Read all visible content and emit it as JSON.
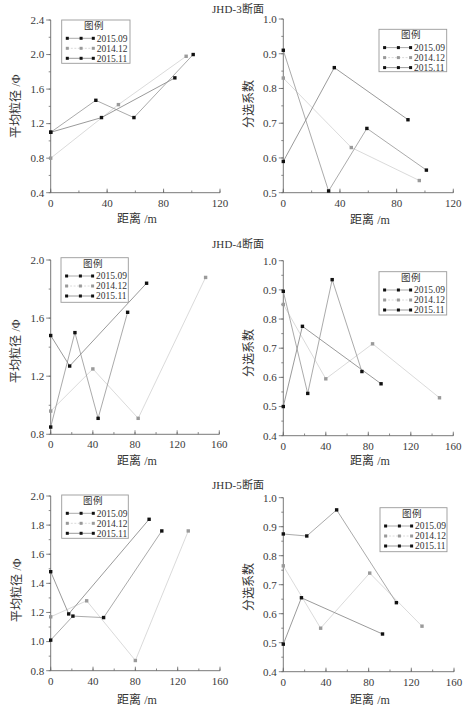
{
  "sections": [
    {
      "title": "JHD-3断面"
    },
    {
      "title": "JHD-4断面"
    },
    {
      "title": "JHD-5断面"
    }
  ],
  "chart_data": [
    {
      "id": "jhd3-mean-grain-size",
      "section": "JHD-3断面",
      "type": "line",
      "title": "",
      "xlabel": "距离 /m",
      "ylabel": "平均粒径 /Φ",
      "xlim": [
        0,
        120
      ],
      "xticks": [
        0,
        40,
        80,
        120
      ],
      "xtick_labels": [
        "0",
        "40",
        "80",
        "120"
      ],
      "xminor": 20,
      "ylim": [
        0.4,
        2.4
      ],
      "yticks": [
        0.4,
        0.8,
        1.2,
        1.6,
        2.0,
        2.4
      ],
      "ytick_labels": [
        "0.4",
        "0.8",
        "1.2",
        "1.6",
        "2.0",
        "2.4"
      ],
      "yminor": 0.2,
      "grid": false,
      "legend_title": "图例",
      "legend_position": "upper left",
      "series": [
        {
          "name": "2015.09",
          "x": [
            0,
            32,
            59,
            101
          ],
          "y": [
            1.1,
            1.47,
            1.27,
            2.0
          ],
          "marker_color": "#111111",
          "line_color": "#a0a0a0"
        },
        {
          "name": "2014.12",
          "x": [
            0,
            48,
            96
          ],
          "y": [
            0.8,
            1.42,
            1.98
          ],
          "marker_color": "#9a9a9a",
          "line_color": "#d6d6d6"
        },
        {
          "name": "2015.11",
          "x": [
            0,
            36,
            88
          ],
          "y": [
            1.1,
            1.27,
            1.73
          ],
          "marker_color": "#111111",
          "line_color": "#8e8e8e"
        }
      ]
    },
    {
      "id": "jhd3-sorting-coefficient",
      "section": "JHD-3断面",
      "type": "line",
      "title": "",
      "xlabel": "距离 /m",
      "ylabel": "分选系数",
      "xlim": [
        0,
        120
      ],
      "xticks": [
        0,
        40,
        80,
        120
      ],
      "xtick_labels": [
        "0",
        "40",
        "80",
        "120"
      ],
      "xminor": 20,
      "ylim": [
        0.5,
        1.0
      ],
      "yticks": [
        0.5,
        0.6,
        0.7,
        0.8,
        0.9,
        1.0
      ],
      "ytick_labels": [
        "0.5",
        "0.6",
        "0.7",
        "0.8",
        "0.9",
        "1.0"
      ],
      "yminor": 0.05,
      "grid": false,
      "legend_title": "图例",
      "legend_position": "upper right",
      "series": [
        {
          "name": "2015.09",
          "x": [
            0,
            32,
            59,
            101
          ],
          "y": [
            0.91,
            0.505,
            0.685,
            0.565
          ],
          "marker_color": "#111111",
          "line_color": "#a0a0a0"
        },
        {
          "name": "2014.12",
          "x": [
            0,
            48,
            96
          ],
          "y": [
            0.83,
            0.63,
            0.535
          ],
          "marker_color": "#9a9a9a",
          "line_color": "#d6d6d6"
        },
        {
          "name": "2015.11",
          "x": [
            0,
            36,
            88
          ],
          "y": [
            0.59,
            0.86,
            0.71
          ],
          "marker_color": "#111111",
          "line_color": "#8e8e8e"
        }
      ]
    },
    {
      "id": "jhd4-mean-grain-size",
      "section": "JHD-4断面",
      "type": "line",
      "title": "",
      "xlabel": "距离 /m",
      "ylabel": "平均粒径 /Φ",
      "xlim": [
        0,
        160
      ],
      "xticks": [
        0,
        40,
        80,
        120,
        160
      ],
      "xtick_labels": [
        "0",
        "40",
        "80",
        "120",
        "160"
      ],
      "xminor": 20,
      "ylim": [
        0.8,
        2.0
      ],
      "yticks": [
        0.8,
        1.2,
        1.6,
        2.0
      ],
      "ytick_labels": [
        "0.8",
        "1.2",
        "1.6",
        "2.0"
      ],
      "yminor": 0.2,
      "grid": false,
      "legend_title": "图例",
      "legend_position": "upper left",
      "series": [
        {
          "name": "2015.09",
          "x": [
            0,
            23,
            45,
            73
          ],
          "y": [
            0.85,
            1.5,
            0.91,
            1.64
          ],
          "marker_color": "#111111",
          "line_color": "#a0a0a0"
        },
        {
          "name": "2014.12",
          "x": [
            0,
            40,
            83,
            147
          ],
          "y": [
            0.96,
            1.25,
            0.91,
            1.88
          ],
          "marker_color": "#9a9a9a",
          "line_color": "#d6d6d6"
        },
        {
          "name": "2015.11",
          "x": [
            0,
            18,
            91
          ],
          "y": [
            1.48,
            1.27,
            1.84
          ],
          "marker_color": "#111111",
          "line_color": "#8e8e8e"
        }
      ]
    },
    {
      "id": "jhd4-sorting-coefficient",
      "section": "JHD-4断面",
      "type": "line",
      "title": "",
      "xlabel": "距离 /m",
      "ylabel": "分选系数",
      "xlim": [
        0,
        160
      ],
      "xticks": [
        0,
        40,
        80,
        120,
        160
      ],
      "xtick_labels": [
        "0",
        "40",
        "80",
        "120",
        "160"
      ],
      "xminor": 20,
      "ylim": [
        0.4,
        1.0
      ],
      "yticks": [
        0.4,
        0.5,
        0.6,
        0.7,
        0.8,
        0.9,
        1.0
      ],
      "ytick_labels": [
        "0.4",
        "0.5",
        "0.6",
        "0.7",
        "0.8",
        "0.9",
        "1.0"
      ],
      "yminor": 0.05,
      "grid": false,
      "legend_title": "图例",
      "legend_position": "upper right",
      "series": [
        {
          "name": "2015.09",
          "x": [
            0,
            23,
            46,
            74
          ],
          "y": [
            0.895,
            0.545,
            0.935,
            0.62
          ],
          "marker_color": "#111111",
          "line_color": "#a0a0a0"
        },
        {
          "name": "2014.12",
          "x": [
            0,
            40,
            84,
            147
          ],
          "y": [
            0.85,
            0.595,
            0.715,
            0.53
          ],
          "marker_color": "#9a9a9a",
          "line_color": "#d6d6d6"
        },
        {
          "name": "2015.11",
          "x": [
            0,
            18,
            92
          ],
          "y": [
            0.5,
            0.775,
            0.578
          ],
          "marker_color": "#111111",
          "line_color": "#8e8e8e"
        }
      ]
    },
    {
      "id": "jhd5-mean-grain-size",
      "section": "JHD-5断面",
      "type": "line",
      "title": "",
      "xlabel": "距离 /m",
      "ylabel": "平均粒径 /Φ",
      "xlim": [
        0,
        160
      ],
      "xticks": [
        0,
        40,
        80,
        120,
        160
      ],
      "xtick_labels": [
        "0",
        "40",
        "80",
        "120",
        "160"
      ],
      "xminor": 20,
      "ylim": [
        0.8,
        2.0
      ],
      "yticks": [
        0.8,
        1.0,
        1.2,
        1.4,
        1.6,
        1.8,
        2.0
      ],
      "ytick_labels": [
        "0.8",
        "1.0",
        "1.2",
        "1.4",
        "1.6",
        "1.8",
        "2.0"
      ],
      "yminor": 0.1,
      "grid": false,
      "legend_title": "图例",
      "legend_position": "upper left",
      "series": [
        {
          "name": "2015.09",
          "x": [
            0,
            21,
            50,
            105
          ],
          "y": [
            1.01,
            1.175,
            1.165,
            1.76
          ],
          "marker_color": "#111111",
          "line_color": "#a0a0a0"
        },
        {
          "name": "2014.12",
          "x": [
            0,
            34,
            80,
            130
          ],
          "y": [
            1.17,
            1.28,
            0.87,
            1.76
          ],
          "marker_color": "#9a9a9a",
          "line_color": "#d6d6d6"
        },
        {
          "name": "2015.11",
          "x": [
            0,
            17,
            93
          ],
          "y": [
            1.48,
            1.19,
            1.84
          ],
          "marker_color": "#111111",
          "line_color": "#8e8e8e"
        }
      ]
    },
    {
      "id": "jhd5-sorting-coefficient",
      "section": "JHD-5断面",
      "type": "line",
      "title": "",
      "xlabel": "距离 /m",
      "ylabel": "分选系数",
      "xlim": [
        0,
        160
      ],
      "xticks": [
        0,
        40,
        80,
        120,
        160
      ],
      "xtick_labels": [
        "0",
        "40",
        "80",
        "120",
        "160"
      ],
      "xminor": 20,
      "ylim": [
        0.4,
        1.0
      ],
      "yticks": [
        0.4,
        0.5,
        0.6,
        0.7,
        0.8,
        0.9,
        1.0
      ],
      "ytick_labels": [
        "0.4",
        "0.5",
        "0.6",
        "0.7",
        "0.8",
        "0.9",
        "1.0"
      ],
      "yminor": 0.05,
      "grid": false,
      "legend_title": "图例",
      "legend_position": "upper right",
      "series": [
        {
          "name": "2015.09",
          "x": [
            0,
            22,
            50,
            106
          ],
          "y": [
            0.875,
            0.868,
            0.958,
            0.638
          ],
          "marker_color": "#111111",
          "line_color": "#a0a0a0"
        },
        {
          "name": "2014.12",
          "x": [
            0,
            35,
            81,
            130
          ],
          "y": [
            0.765,
            0.55,
            0.74,
            0.557
          ],
          "marker_color": "#9a9a9a",
          "line_color": "#d6d6d6"
        },
        {
          "name": "2015.11",
          "x": [
            0,
            17,
            93
          ],
          "y": [
            0.495,
            0.655,
            0.53
          ],
          "marker_color": "#111111",
          "line_color": "#8e8e8e"
        }
      ]
    }
  ]
}
